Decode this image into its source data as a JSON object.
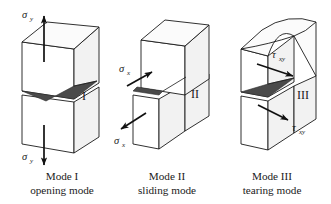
{
  "figure": {
    "background_color": "#ffffff",
    "line_color": "#1a1a1a",
    "face_front_color": "#ffffff",
    "face_top_color": "#fbfbfb",
    "face_side_color": "#f2f2f2",
    "crack_fill_color": "#4a4a4a",
    "arrow_color": "#111111"
  },
  "panels": [
    {
      "id": "mode-1",
      "numeral": "I",
      "caption_line1": "Mode I",
      "caption_line2": "opening mode",
      "load_labels": [
        {
          "id": "sigma-y-top",
          "symbol": "σ",
          "subscript": "y",
          "direction": "up"
        },
        {
          "id": "sigma-y-bottom",
          "symbol": "σ",
          "subscript": "y",
          "direction": "down"
        }
      ]
    },
    {
      "id": "mode-2",
      "numeral": "II",
      "caption_line1": "Mode II",
      "caption_line2": "sliding mode",
      "load_labels": [
        {
          "id": "sigma-x-top",
          "symbol": "σ",
          "subscript": "x",
          "direction": "up-right"
        },
        {
          "id": "sigma-x-bottom",
          "symbol": "σ",
          "subscript": "x",
          "direction": "down-left"
        }
      ]
    },
    {
      "id": "mode-3",
      "numeral": "III",
      "caption_line1": "Mode III",
      "caption_line2": "tearing mode",
      "load_labels": [
        {
          "id": "tau-xy-top",
          "symbol": "τ",
          "subscript": "xy",
          "direction": "right"
        },
        {
          "id": "tau-xy-bottom",
          "symbol": "τ",
          "subscript": "xy",
          "direction": "down-right"
        }
      ]
    }
  ]
}
